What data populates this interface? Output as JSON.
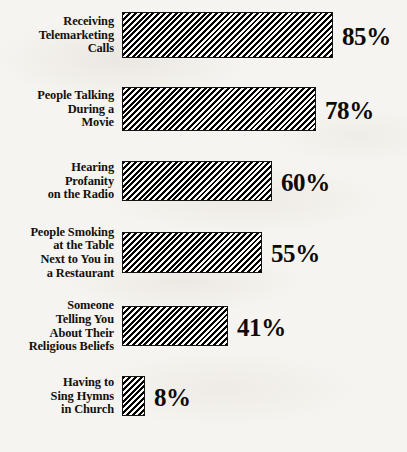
{
  "chart_data": {
    "type": "bar",
    "orientation": "horizontal",
    "title": "",
    "subtitle": "",
    "xlabel": "",
    "ylabel": "",
    "xlim": [
      0,
      100
    ],
    "grid": false,
    "legend": null,
    "value_suffix": "%",
    "categories": [
      "Receiving\nTelemarketing\nCalls",
      "People Talking\nDuring a\nMovie",
      "Hearing\nProfanity\non the Radio",
      "People Smoking\nat the Table\nNext to You in\na Restaurant",
      "Someone\nTelling You\nAbout Their\nReligious Beliefs",
      "Having to\nSing Hymns\nin Church"
    ],
    "values": [
      85,
      78,
      60,
      55,
      41,
      8
    ],
    "value_labels": [
      "85%",
      "78%",
      "60%",
      "55%",
      "41%",
      "8%"
    ],
    "colors": {
      "background": "#f6f4f0",
      "bar_fill": "#000000",
      "bar_hatch_gap": "#fbfaf7",
      "bar_border": "#141414",
      "text": "#13100d"
    },
    "bar_style": "diagonal-hatch"
  },
  "rows": [
    {
      "label": "Receiving\nTelemarketing\nCalls",
      "value_label": "85%",
      "top": 12,
      "height": 46,
      "width": 211
    },
    {
      "label": "People Talking\nDuring a\nMovie",
      "value_label": "78%",
      "top": 87,
      "height": 44,
      "width": 194
    },
    {
      "label": "Hearing\nProfanity\non the Radio",
      "value_label": "60%",
      "top": 161,
      "height": 40,
      "width": 150
    },
    {
      "label": "People Smoking\nat the Table\nNext to You in\na Restaurant",
      "value_label": "55%",
      "top": 232,
      "height": 41,
      "width": 140
    },
    {
      "label": "Someone\nTelling You\nAbout Their\nReligious Beliefs",
      "value_label": "41%",
      "top": 306,
      "height": 40,
      "width": 106
    },
    {
      "label": "Having to\nSing Hymns\nin Church",
      "value_label": "8%",
      "top": 376,
      "height": 40,
      "width": 23
    }
  ]
}
